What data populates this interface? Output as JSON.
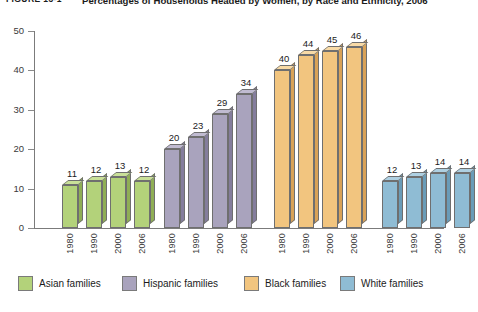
{
  "header": {
    "figure_label": "FIGURE 13-1",
    "title": "Percentages of Households Headed by Women, by Race and Ethnicity, 2006"
  },
  "chart_data": {
    "type": "bar",
    "title": "Percentages of Households Headed by Women, by Race and Ethnicity, 2006",
    "xlabel": "",
    "ylabel": "",
    "ylim": [
      0,
      50
    ],
    "yticks": [
      0,
      10,
      20,
      30,
      40,
      50
    ],
    "grid": false,
    "legend_position": "bottom",
    "categories": [
      "1980",
      "1990",
      "2000",
      "2006"
    ],
    "series": [
      {
        "name": "Asian families",
        "color": "#b3d27a",
        "values": [
          11,
          12,
          13,
          12
        ]
      },
      {
        "name": "Hispanic families",
        "color": "#a9a3bd",
        "values": [
          20,
          23,
          29,
          34
        ]
      },
      {
        "name": "Black families",
        "color": "#f2c57f",
        "values": [
          40,
          44,
          45,
          46
        ]
      },
      {
        "name": "White families",
        "color": "#8fbcd4",
        "values": [
          12,
          13,
          14,
          14
        ]
      }
    ]
  }
}
